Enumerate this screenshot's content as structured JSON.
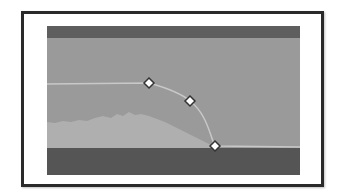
{
  "editor": {
    "name": "envelope-curve-editor",
    "colors": {
      "frame_border": "#2a2a2a",
      "panel_background": "#9a9a9a",
      "top_band": "#5e5e5e",
      "bottom_band": "#555555",
      "waveform": "#b3b3b3",
      "curve_line": "#c8c8c8",
      "handle_fill": "#ffffff",
      "handle_stroke": "#333333"
    },
    "curve": {
      "path": "M0,58 L102,57 C120,62 135,68 143,75 C160,88 163,110 168,120 L253,121",
      "handles": [
        {
          "name": "control-point-1",
          "x": 102,
          "y": 57
        },
        {
          "name": "control-point-2",
          "x": 143,
          "y": 75
        },
        {
          "name": "control-point-3",
          "x": 168,
          "y": 120
        }
      ]
    },
    "waveform": {
      "path": "M0,122 L0,96 L8,97 L16,95 L24,96 L32,94 L40,95 L48,92 L56,90 L64,92 L70,88 L76,90 L82,86 L88,89 L94,88 L102,90 L110,93 L118,96 L126,100 L134,104 L142,108 L150,112 L158,116 L166,120 L172,122 Z"
    }
  }
}
